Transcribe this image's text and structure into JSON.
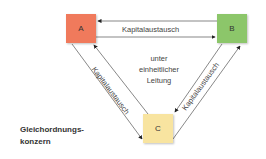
{
  "diagram": {
    "nodes": [
      {
        "id": "A",
        "label": "A",
        "color": "#f07a5c"
      },
      {
        "id": "B",
        "label": "B",
        "color": "#8cc66a"
      },
      {
        "id": "C",
        "label": "C",
        "color": "#f8e4a0"
      }
    ],
    "edges": [
      {
        "from": "A",
        "to": "B",
        "label": "Kapitalaustausch",
        "bidirectional": true
      },
      {
        "from": "A",
        "to": "C",
        "label": "Kapitalaustausch",
        "bidirectional": true
      },
      {
        "from": "B",
        "to": "C",
        "label": "Kapitalaustausch",
        "bidirectional": true
      }
    ],
    "center_text": [
      "unter",
      "einheitlicher",
      "Leitung"
    ],
    "caption": [
      "Gleichordnungs-",
      "konzern"
    ]
  }
}
